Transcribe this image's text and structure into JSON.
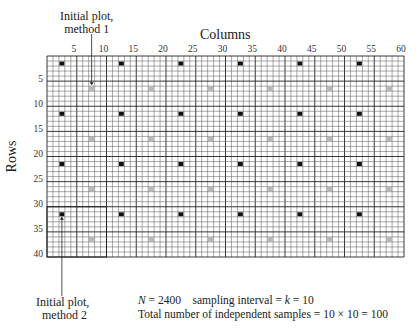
{
  "title": "Columns",
  "y_axis_label": "Rows",
  "annotations": {
    "method1": [
      "Initial plot,",
      "method 1"
    ],
    "method2": [
      "Initial plot,",
      "method 2"
    ]
  },
  "footer": {
    "line1_n": "N",
    "line1_rest": " = 2400    sampling interval = ",
    "line1_k": "k",
    "line1_end": " = 10",
    "line2": "Total number of independent samples = 10 × 10 = 100"
  },
  "grid": {
    "columns": 60,
    "rows": 40,
    "col_ticks": [
      "5",
      "10",
      "15",
      "20",
      "25",
      "30",
      "35",
      "40",
      "45",
      "50",
      "55",
      "60"
    ],
    "row_ticks": [
      "5",
      "10",
      "15",
      "20",
      "25",
      "30",
      "35",
      "40"
    ],
    "black_squares": {
      "start_col": 3,
      "start_row": 2,
      "step": 10
    },
    "gray_squares": {
      "start_col": 8,
      "start_row": 7,
      "step": 10
    },
    "colors": {
      "black": "#111111",
      "gray": "#b8b8b8",
      "line": "#555555",
      "major_line": "#222222"
    }
  }
}
